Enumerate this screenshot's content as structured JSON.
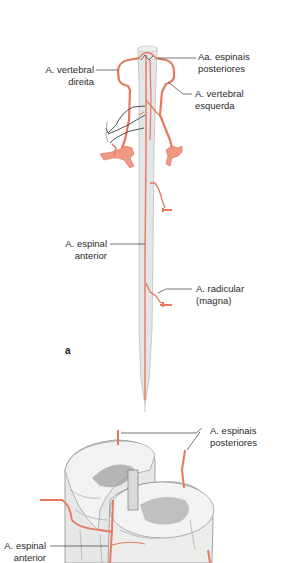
{
  "figure": {
    "panel_a": {
      "letter": "a",
      "labels": {
        "aa_espinais_posteriores": {
          "line1": "Aa. espinais",
          "line2": "posteriores"
        },
        "a_vertebral_direita": {
          "line1": "A. vertebral",
          "line2": "direita"
        },
        "a_vertebral_esquerda": {
          "line1": "A. vertebral",
          "line2": "esquerda"
        },
        "a_espinal_anterior": {
          "line1": "A. espinal",
          "line2": "anterior"
        },
        "a_radicular_magna": {
          "line1": "A. radicular",
          "line2": "(magna)"
        }
      }
    },
    "panel_b": {
      "labels": {
        "a_espinais_posteriores": {
          "line1": "A. espinais",
          "line2": "posteriores"
        },
        "a_espinal_anterior": {
          "line1": "A. espinal",
          "line2": "anterior"
        }
      }
    },
    "colors": {
      "artery": "#e8775e",
      "artery_light": "#f09a86",
      "cord": "#e3e6e6",
      "cord_edge": "#b9c0c2",
      "leader": "#3a3a3a",
      "vein_dark": "#4a5656",
      "grey_matter": "#8d8f8f"
    }
  }
}
